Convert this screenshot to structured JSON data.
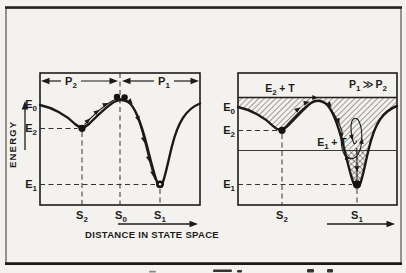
{
  "colors": {
    "paper": "#f3f2ee",
    "ink": "#1d1c1a",
    "frame": "#3a3935"
  },
  "left_panel": {
    "span_p2": {
      "base": "P",
      "sub": "2"
    },
    "span_p1": {
      "base": "P",
      "sub": "1"
    },
    "energy_axis_title": "ENERGY",
    "x_axis_title": "DISTANCE IN STATE SPACE",
    "e0": {
      "base": "E",
      "sub": "0"
    },
    "e2": {
      "base": "E",
      "sub": "2"
    },
    "e1": {
      "base": "E",
      "sub": "1"
    },
    "s2": {
      "base": "S",
      "sub": "2"
    },
    "s0": {
      "base": "S",
      "sub": "0"
    },
    "s1": {
      "base": "S",
      "sub": "1"
    }
  },
  "right_panel": {
    "condition": {
      "lhs": {
        "base": "P",
        "sub": "1"
      },
      "op": "≫",
      "rhs": {
        "base": "P",
        "sub": "2"
      }
    },
    "e2_plus_t": {
      "base": "E",
      "sub": "2",
      "suffix": "+ T"
    },
    "e1_plus_t": {
      "base": "E",
      "sub": "1",
      "suffix": "+ T"
    },
    "e0": {
      "base": "E",
      "sub": "0"
    },
    "e2": {
      "base": "E",
      "sub": "2"
    },
    "e1": {
      "base": "E",
      "sub": "1"
    },
    "s2": {
      "base": "S",
      "sub": "2"
    },
    "s1": {
      "base": "S",
      "sub": "1"
    }
  }
}
